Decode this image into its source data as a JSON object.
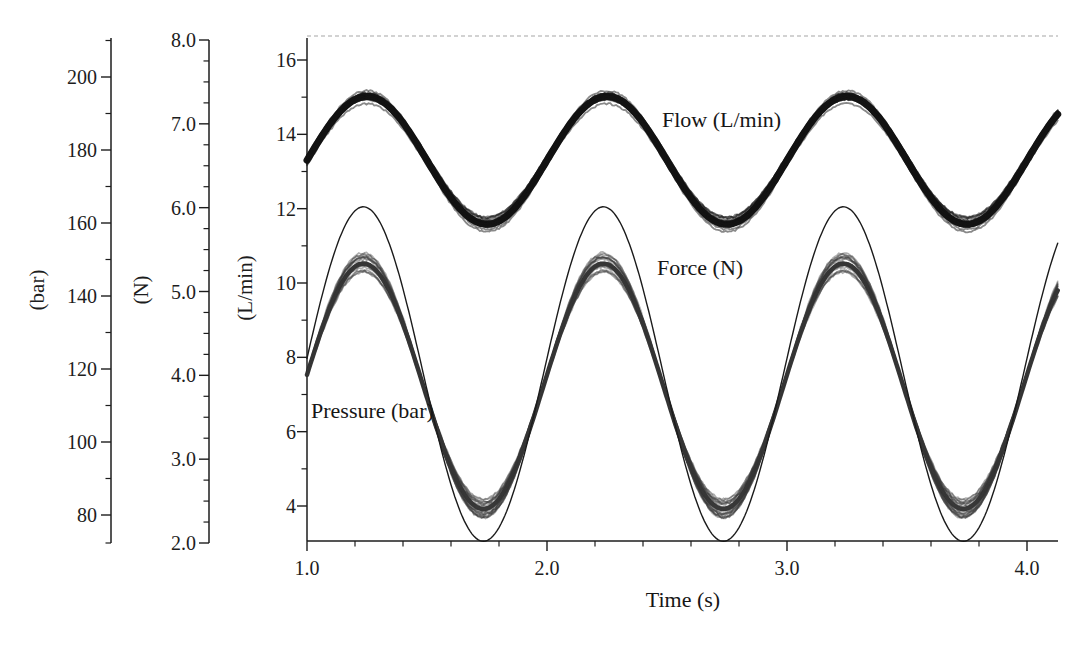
{
  "figure": {
    "background_color": "#ffffff",
    "ink_color": "#1d1d1d",
    "top_border_color": "#c3c3c3"
  },
  "chart_data": {
    "type": "line",
    "title": "",
    "xlabel": "Time (s)",
    "grid": "off",
    "legend": "inline-annotations",
    "x_axis": {
      "range": [
        1.0,
        4.13
      ],
      "major_ticks": [
        1.0,
        2.0,
        3.0,
        4.0
      ],
      "minor_step": 0.2,
      "tick_decimals": 1
    },
    "y_axes": [
      {
        "id": "pressure",
        "unit_label": "(bar)",
        "major_ticks": [
          200,
          180,
          160,
          140,
          120,
          100,
          80
        ],
        "minor_step": 10,
        "shown_range": [
          72,
          210
        ],
        "tick_decimals": 0
      },
      {
        "id": "force",
        "unit_label": "(N)",
        "major_ticks": [
          8.0,
          7.0,
          6.0,
          5.0,
          4.0,
          3.0,
          2.0
        ],
        "minor_step": 0.25,
        "shown_range": [
          2.0,
          8.0
        ],
        "tick_decimals": 1
      },
      {
        "id": "flow",
        "unit_label": "(L/min)",
        "major_ticks": [
          16,
          14,
          12,
          10,
          8,
          6,
          4
        ],
        "minor_step": 1,
        "shown_range": [
          3.05,
          16.6
        ],
        "tick_decimals": 0
      }
    ],
    "series": [
      {
        "name": "Flow",
        "label": "Flow (L/min)",
        "axis": "flow",
        "unit": "L/min",
        "waveform": "sine",
        "period_s": 1.0,
        "mean": 13.3,
        "amplitude": 1.72,
        "max": 15.0,
        "min": 11.6,
        "peak_times_s": [
          1.25,
          2.25,
          3.25
        ],
        "trough_times_s": [
          1.75,
          2.75,
          3.75
        ],
        "line_style": "thick-noisy-band",
        "band_width_lpm": 0.35,
        "render_on_flow_axis": {
          "mean": 13.3,
          "amplitude": 1.72,
          "phase_zero_t": 1.0
        }
      },
      {
        "name": "Force",
        "label": "Force (N)",
        "axis": "force",
        "unit": "N",
        "waveform": "sine",
        "period_s": 1.0,
        "mean": 4.0,
        "amplitude": 2.0,
        "max": 6.0,
        "min": 2.0,
        "peak_times_s": [
          1.24,
          2.24,
          3.24
        ],
        "trough_times_s": [
          1.74,
          2.74,
          3.74
        ],
        "line_style": "thin-line",
        "render_on_flow_axis": {
          "mean": 7.55,
          "amplitude": 4.5,
          "phase_zero_t": 0.985
        }
      },
      {
        "name": "Pressure",
        "label": "Pressure (bar)",
        "axis": "pressure",
        "unit": "bar",
        "waveform": "sine",
        "period_s": 1.0,
        "mean": 113,
        "amplitude": 33,
        "max": 146,
        "min": 80,
        "peak_times_s": [
          1.24,
          2.24,
          3.24
        ],
        "trough_times_s": [
          1.74,
          2.74,
          3.74
        ],
        "line_style": "thick-noisy-band",
        "band_width_bar": 6,
        "render_on_flow_axis": {
          "mean": 7.22,
          "amplitude": 3.3,
          "phase_zero_t": 0.985
        }
      }
    ],
    "samples": {
      "t_s": [
        1.0,
        1.25,
        1.5,
        1.75,
        2.0,
        2.25,
        2.5,
        2.75,
        3.0,
        3.25,
        3.5,
        3.75,
        4.0
      ],
      "flow_lpm": [
        13.3,
        15.0,
        13.3,
        11.6,
        13.3,
        15.0,
        13.3,
        11.6,
        13.3,
        15.0,
        13.3,
        11.6,
        13.3
      ],
      "force_n": [
        4.2,
        6.0,
        3.8,
        2.0,
        4.2,
        6.0,
        3.8,
        2.0,
        4.2,
        6.0,
        3.8,
        2.0,
        4.2
      ],
      "pressure_bar": [
        116,
        146,
        110,
        80,
        116,
        146,
        110,
        80,
        116,
        146,
        110,
        80,
        116
      ]
    }
  }
}
